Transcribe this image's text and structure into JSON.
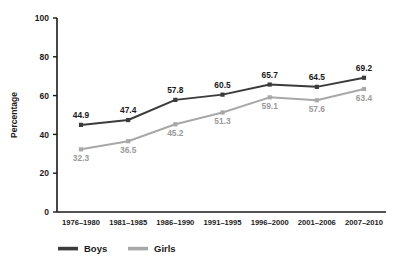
{
  "chart_data": {
    "type": "line",
    "title": "",
    "xlabel": "",
    "ylabel": "Percentage",
    "ylim": [
      0,
      100
    ],
    "yticks": [
      "0",
      "20",
      "40",
      "60",
      "80",
      "100"
    ],
    "grid": false,
    "legend_position": "bottom",
    "categories": [
      "1976–1980",
      "1981–1985",
      "1986–1990",
      "1991–1995",
      "1996–2000",
      "2001–2006",
      "2007–2010"
    ],
    "series": [
      {
        "name": "Boys",
        "color": "#3b3b3b",
        "values": [
          44.9,
          47.4,
          57.8,
          60.5,
          65.7,
          64.5,
          69.2
        ],
        "labels": [
          "44.9",
          "47.4",
          "57.8",
          "60.5",
          "65.7",
          "64.5",
          "69.2"
        ]
      },
      {
        "name": "Girls",
        "color": "#a8a8a8",
        "values": [
          32.3,
          36.5,
          45.2,
          51.3,
          59.1,
          57.6,
          63.4
        ],
        "labels": [
          "32.3",
          "36.5",
          "45.2",
          "51.3",
          "59.1",
          "57.6",
          "63.4"
        ]
      }
    ]
  },
  "axis": {
    "y_label": "Percentage",
    "y_ticks": [
      "100",
      "80",
      "60",
      "40",
      "20",
      "0"
    ]
  },
  "legend": {
    "items": [
      {
        "label": "Boys",
        "color": "#3b3b3b"
      },
      {
        "label": "Girls",
        "color": "#a8a8a8"
      }
    ]
  }
}
